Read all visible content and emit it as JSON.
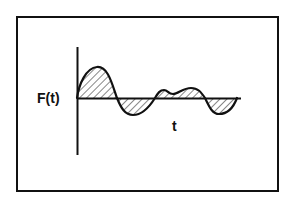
{
  "diagram": {
    "y_label": "F(t)",
    "x_label": "t",
    "colors": {
      "stroke": "#111111",
      "background": "#ffffff"
    }
  }
}
